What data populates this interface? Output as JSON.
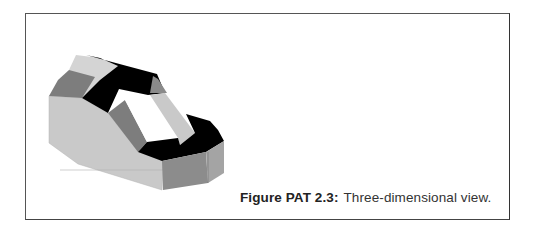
{
  "figure": {
    "label": "Figure PAT 2.3:",
    "caption": "Three-dimensional view."
  },
  "colors": {
    "frame": "#555555",
    "face_light": "#c9c9c9",
    "face_light_top": "#d4d4d4",
    "face_mid": "#7d7d7d",
    "face_mid_dark": "#8a8a8a",
    "face_dark": "#000000",
    "hole": "#ffffff"
  }
}
